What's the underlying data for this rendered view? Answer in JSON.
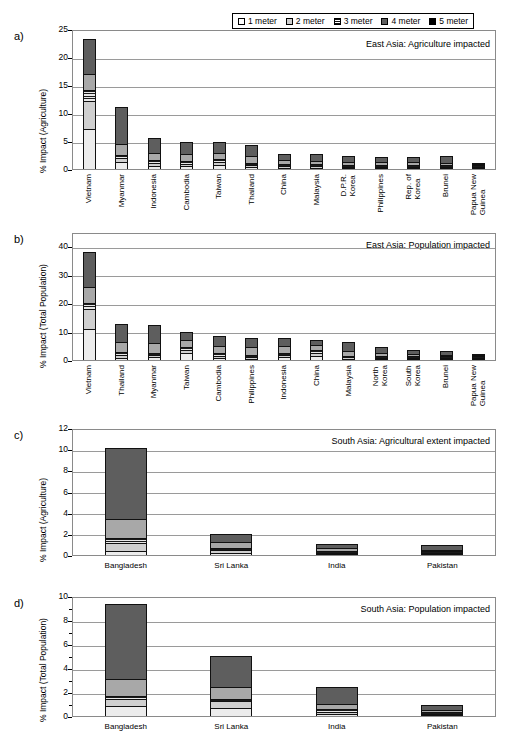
{
  "figure": {
    "legend": {
      "items": [
        {
          "label": "1 meter",
          "icon": "swatch-1m",
          "color": "#ffffff"
        },
        {
          "label": "2 meter",
          "icon": "swatch-2m",
          "color": "#cfcfcf"
        },
        {
          "label": "3 meter",
          "icon": "swatch-3m",
          "color": "#888888"
        },
        {
          "label": "4 meter",
          "icon": "swatch-4m",
          "color": "#5e5e5e"
        },
        {
          "label": "5 meter",
          "icon": "swatch-5m",
          "color": "#000000"
        }
      ]
    },
    "panels": [
      {
        "letter": "a)"
      },
      {
        "letter": "b)"
      },
      {
        "letter": "c)"
      },
      {
        "letter": "d)"
      }
    ]
  },
  "chart_data": [
    {
      "type": "bar",
      "stacked": true,
      "panel": "a)",
      "title": "East Asia: Agriculture impacted",
      "xlabel": "",
      "ylabel": "% Impact (Agriculture)",
      "ylim": [
        0,
        25
      ],
      "yticks": [
        0,
        5,
        10,
        15,
        20,
        25
      ],
      "grid": true,
      "legend_position": "top-right-outside",
      "categories": [
        "Vietnam",
        "Myanmar",
        "Indonesia",
        "Cambodia",
        "Taiwan",
        "Thailand",
        "China",
        "Malaysia",
        "D.P.R. Korea",
        "Philippines",
        "Rep. of Korea",
        "Brunei",
        "Papua New Guinea"
      ],
      "series": [
        {
          "name": "1 meter",
          "values": [
            7.1,
            1.25,
            0.55,
            0.45,
            0.8,
            0.3,
            0.25,
            0.1,
            0.1,
            0.1,
            0.1,
            0.05,
            0.02
          ]
        },
        {
          "name": "2 meter",
          "values": [
            5.1,
            0.7,
            0.45,
            0.4,
            0.5,
            0.35,
            0.3,
            0.25,
            0.2,
            0.2,
            0.15,
            0.1,
            0.05
          ]
        },
        {
          "name": "3 meter",
          "values": [
            2.0,
            0.55,
            0.55,
            0.5,
            0.5,
            0.5,
            0.4,
            0.35,
            0.3,
            0.3,
            0.25,
            0.2,
            0.08
          ]
        },
        {
          "name": "4 meter",
          "values": [
            2.8,
            1.95,
            1.35,
            1.25,
            1.15,
            1.2,
            0.75,
            0.7,
            0.6,
            0.6,
            0.55,
            0.45,
            0.12
          ]
        },
        {
          "name": "5 meter",
          "values": [
            6.3,
            6.65,
            2.65,
            2.3,
            1.85,
            1.95,
            1.05,
            1.1,
            1.05,
            0.85,
            0.95,
            1.2,
            0.23
          ]
        }
      ],
      "totals": [
        23.3,
        11.1,
        5.55,
        4.9,
        4.8,
        4.3,
        2.75,
        2.5,
        2.25,
        2.05,
        2.0,
        2.0,
        0.5
      ]
    },
    {
      "type": "bar",
      "stacked": true,
      "panel": "b)",
      "title": "East Asia: Population impacted",
      "xlabel": "",
      "ylabel": "% Impact (Total Population)",
      "ylim": [
        0,
        45
      ],
      "yticks": [
        0,
        10,
        20,
        30,
        40
      ],
      "grid": true,
      "categories": [
        "Vietnam",
        "Thailand",
        "Myanmar",
        "Taiwan",
        "Cambodia",
        "Philippines",
        "Indonesia",
        "China",
        "Malaysia",
        "North Korea",
        "South Korea",
        "Brunei",
        "Papua New Guinea"
      ],
      "series": [
        {
          "name": "1 meter",
          "values": [
            11.0,
            0.8,
            0.9,
            2.4,
            0.7,
            0.5,
            0.9,
            1.5,
            0.4,
            0.2,
            0.15,
            0.1,
            0.05
          ]
        },
        {
          "name": "2 meter",
          "values": [
            7.0,
            0.9,
            0.8,
            1.3,
            0.8,
            0.6,
            0.8,
            1.1,
            0.5,
            0.3,
            0.2,
            0.15,
            0.05
          ]
        },
        {
          "name": "3 meter",
          "values": [
            2.0,
            1.0,
            0.9,
            1.0,
            0.9,
            0.8,
            0.9,
            0.9,
            0.6,
            0.4,
            0.25,
            0.2,
            0.05
          ]
        },
        {
          "name": "4 meter",
          "values": [
            5.5,
            3.5,
            3.3,
            2.5,
            2.6,
            2.6,
            2.4,
            1.8,
            1.8,
            1.1,
            0.7,
            0.5,
            0.1
          ]
        },
        {
          "name": "5 meter",
          "values": [
            12.5,
            6.3,
            6.4,
            2.6,
            3.4,
            3.4,
            2.6,
            1.9,
            3.0,
            2.1,
            1.6,
            1.4,
            0.25
          ]
        }
      ],
      "totals": [
        38.0,
        12.5,
        12.3,
        9.8,
        8.4,
        7.9,
        7.6,
        7.2,
        6.3,
        4.1,
        2.9,
        2.35,
        0.5
      ]
    },
    {
      "type": "bar",
      "stacked": true,
      "panel": "c)",
      "title": "South Asia: Agricultural extent impacted",
      "xlabel": "",
      "ylabel": "% Impact (Agriculture)",
      "ylim": [
        0,
        12
      ],
      "yticks": [
        0,
        2,
        4,
        6,
        8,
        10,
        12
      ],
      "grid": true,
      "categories": [
        "Bangladesh",
        "Sri Lanka",
        "India",
        "Pakistan"
      ],
      "series": [
        {
          "name": "1 meter",
          "values": [
            0.35,
            0.15,
            0.08,
            0.04
          ]
        },
        {
          "name": "2 meter",
          "values": [
            0.75,
            0.3,
            0.12,
            0.06
          ]
        },
        {
          "name": "3 meter",
          "values": [
            0.5,
            0.25,
            0.15,
            0.08
          ]
        },
        {
          "name": "4 meter",
          "values": [
            1.8,
            0.5,
            0.25,
            0.12
          ]
        },
        {
          "name": "5 meter",
          "values": [
            6.7,
            0.8,
            0.4,
            0.45
          ]
        }
      ],
      "totals": [
        10.1,
        2.0,
        1.0,
        0.75
      ]
    },
    {
      "type": "bar",
      "stacked": true,
      "panel": "d)",
      "title": "South Asia: Population impacted",
      "xlabel": "",
      "ylabel": "% Impact (Total Population)",
      "ylim": [
        0,
        10
      ],
      "yticks": [
        0,
        2,
        4,
        6,
        8,
        10
      ],
      "grid": true,
      "categories": [
        "Bangladesh",
        "Sri Lanka",
        "India",
        "Pakistan"
      ],
      "series": [
        {
          "name": "1 meter",
          "values": [
            0.8,
            0.7,
            0.15,
            0.05
          ]
        },
        {
          "name": "2 meter",
          "values": [
            0.65,
            0.55,
            0.2,
            0.08
          ]
        },
        {
          "name": "3 meter",
          "values": [
            0.25,
            0.2,
            0.2,
            0.12
          ]
        },
        {
          "name": "4 meter",
          "values": [
            1.4,
            0.95,
            0.45,
            0.15
          ]
        },
        {
          "name": "5 meter",
          "values": [
            6.2,
            2.6,
            1.4,
            0.45
          ]
        }
      ],
      "totals": [
        9.3,
        5.0,
        2.4,
        0.85
      ]
    }
  ]
}
